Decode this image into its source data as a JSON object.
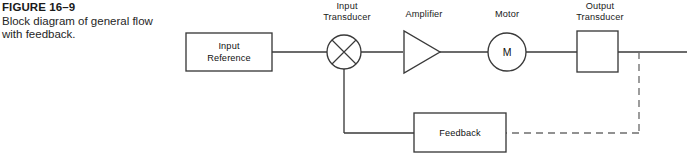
{
  "figure": {
    "number": "FIGURE 16–9",
    "caption": "Block diagram of general flow with feedback."
  },
  "diagram": {
    "title": "Block diagram of general flow with feedback",
    "labels": {
      "input_transducer_line1": "Input",
      "input_transducer_line2": "Transducer",
      "amplifier": "Amplifier",
      "motor": "Motor",
      "output_transducer_line1": "Output",
      "output_transducer_line2": "Transducer"
    },
    "blocks": {
      "input_reference_line1": "Input",
      "input_reference_line2": "Reference",
      "motor_symbol": "M",
      "feedback": "Feedback"
    },
    "colors": {
      "stroke": "#3a3a3a",
      "dashed_stroke": "#6e6e6e",
      "text": "#1a1a1a",
      "background": "#ffffff"
    }
  }
}
